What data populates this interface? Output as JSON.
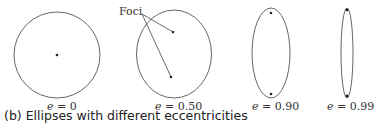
{
  "figure": {
    "caption": "(b) Ellipses with different eccentricities",
    "foci_label": "Foci",
    "ellipses": [
      {
        "label": "e = 0",
        "eccentricity": "0"
      },
      {
        "label": "e = 0.50",
        "eccentricity": "0.50"
      },
      {
        "label": "e = 0.90",
        "eccentricity": "0.90"
      },
      {
        "label": "e = 0.99",
        "eccentricity": "0.99"
      }
    ],
    "e_symbol": "e",
    "values": [
      "= 0",
      "= 0.50",
      "= 0.90",
      "= 0.99"
    ]
  },
  "colors": {
    "stroke": "#666666",
    "dot": "#222222"
  }
}
